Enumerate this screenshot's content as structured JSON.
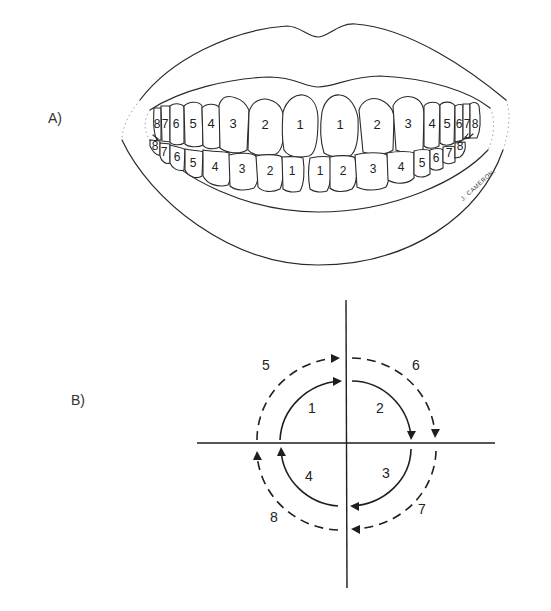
{
  "panels": {
    "a": {
      "label": "A)",
      "upper_teeth": [
        {
          "n": "8",
          "x": 157,
          "y": 125
        },
        {
          "n": "7",
          "x": 165,
          "y": 125
        },
        {
          "n": "6",
          "x": 175,
          "y": 125
        },
        {
          "n": "5",
          "x": 193,
          "y": 125
        },
        {
          "n": "4",
          "x": 210,
          "y": 125
        },
        {
          "n": "3",
          "x": 233,
          "y": 125
        },
        {
          "n": "2",
          "x": 265,
          "y": 126
        },
        {
          "n": "1",
          "x": 300,
          "y": 126
        },
        {
          "n": "1",
          "x": 341,
          "y": 126
        },
        {
          "n": "2",
          "x": 377,
          "y": 126
        },
        {
          "n": "3",
          "x": 408,
          "y": 125
        },
        {
          "n": "4",
          "x": 431,
          "y": 125
        },
        {
          "n": "5",
          "x": 446,
          "y": 125
        },
        {
          "n": "6",
          "x": 458,
          "y": 125
        },
        {
          "n": "7",
          "x": 466,
          "y": 125
        },
        {
          "n": "8",
          "x": 475,
          "y": 125
        }
      ],
      "lower_teeth": [
        {
          "n": "8",
          "x": 155,
          "y": 147
        },
        {
          "n": "7",
          "x": 164,
          "y": 153
        },
        {
          "n": "6",
          "x": 177,
          "y": 158
        },
        {
          "n": "5",
          "x": 192,
          "y": 164
        },
        {
          "n": "4",
          "x": 215,
          "y": 168
        },
        {
          "n": "3",
          "x": 242,
          "y": 170
        },
        {
          "n": "2",
          "x": 270,
          "y": 172
        },
        {
          "n": "1",
          "x": 292,
          "y": 172
        },
        {
          "n": "1",
          "x": 320,
          "y": 172
        },
        {
          "n": "2",
          "x": 343,
          "y": 172
        },
        {
          "n": "3",
          "x": 373,
          "y": 170
        },
        {
          "n": "4",
          "x": 401,
          "y": 168
        },
        {
          "n": "5",
          "x": 421,
          "y": 164
        },
        {
          "n": "6",
          "x": 435,
          "y": 159
        },
        {
          "n": "7",
          "x": 449,
          "y": 154
        },
        {
          "n": "8",
          "x": 460,
          "y": 147
        }
      ],
      "signature": "J. CAMERON."
    },
    "b": {
      "label": "B)",
      "center": {
        "x": 346,
        "y": 443
      },
      "inner_arcs": [
        {
          "n": "1",
          "x": 312,
          "y": 409,
          "style": "solid"
        },
        {
          "n": "2",
          "x": 380,
          "y": 409,
          "style": "solid"
        },
        {
          "n": "3",
          "x": 386,
          "y": 474,
          "style": "solid"
        },
        {
          "n": "4",
          "x": 309,
          "y": 477,
          "style": "solid"
        }
      ],
      "outer_arcs": [
        {
          "n": "5",
          "x": 266,
          "y": 366,
          "style": "dashed"
        },
        {
          "n": "6",
          "x": 416,
          "y": 366,
          "style": "dashed"
        },
        {
          "n": "7",
          "x": 422,
          "y": 510,
          "style": "dashed"
        },
        {
          "n": "8",
          "x": 274,
          "y": 518,
          "style": "dashed"
        }
      ]
    }
  }
}
